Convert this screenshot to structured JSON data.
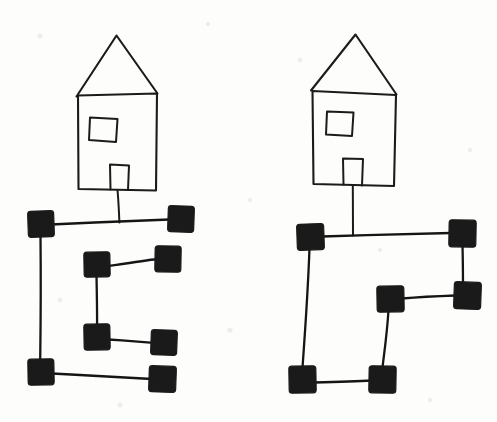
{
  "page": {
    "width": 497,
    "height": 422,
    "background_color": "#fdfdfc",
    "ink_color": "#1b1b1b",
    "node_fill_color": "#1a1a1a"
  },
  "figures": [
    {
      "id": "left-figure",
      "label": "Left house and graph",
      "house": {
        "label": "Left house",
        "roof": {
          "apex": [
            117,
            36
          ],
          "left_eave": [
            76,
            96
          ],
          "right_eave": [
            157,
            93
          ]
        },
        "body": {
          "top_left": [
            78,
            95
          ],
          "top_right": [
            157,
            93
          ],
          "bottom_right": [
            156,
            190
          ],
          "bottom_left": [
            78,
            189
          ]
        },
        "window": {
          "top_left": [
            90,
            117
          ],
          "top_right": [
            117,
            119
          ],
          "bottom_right": [
            116,
            142
          ],
          "bottom_left": [
            89,
            140
          ]
        },
        "door": {
          "top_left": [
            110,
            164
          ],
          "top_right": [
            129,
            165
          ],
          "bottom_right": [
            128,
            190
          ],
          "bottom_left": [
            110,
            189
          ]
        },
        "stem": {
          "from": [
            118,
            190
          ],
          "to": [
            119,
            222
          ]
        }
      },
      "graph": {
        "node_size": 25,
        "nodes": [
          {
            "id": "L1",
            "label": "node-top-left",
            "x": 28,
            "y": 211,
            "w": 26,
            "h": 26
          },
          {
            "id": "L2",
            "label": "node-top-right",
            "x": 168,
            "y": 206,
            "w": 26,
            "h": 26
          },
          {
            "id": "L3",
            "label": "node-upper-mid",
            "x": 84,
            "y": 252,
            "w": 26,
            "h": 25
          },
          {
            "id": "L4",
            "label": "node-upper-right",
            "x": 155,
            "y": 246,
            "w": 26,
            "h": 26
          },
          {
            "id": "L5",
            "label": "node-lower-mid",
            "x": 84,
            "y": 324,
            "w": 26,
            "h": 26
          },
          {
            "id": "L6",
            "label": "node-lower-right",
            "x": 151,
            "y": 330,
            "w": 26,
            "h": 25
          },
          {
            "id": "L7",
            "label": "node-bottom-left",
            "x": 28,
            "y": 359,
            "w": 26,
            "h": 26
          },
          {
            "id": "L8",
            "label": "node-bottom-right",
            "x": 149,
            "y": 366,
            "w": 27,
            "h": 26
          }
        ],
        "edges": [
          {
            "id": "LE1",
            "label": "edge-top-horizontal",
            "from": "L1",
            "to": "L2"
          },
          {
            "id": "LE2",
            "label": "edge-left-vertical",
            "from": "L1",
            "to": "L7"
          },
          {
            "id": "LE3",
            "label": "edge-upper-horizontal",
            "from": "L3",
            "to": "L4"
          },
          {
            "id": "LE4",
            "label": "edge-mid-vertical",
            "from": "L3",
            "to": "L5"
          },
          {
            "id": "LE5",
            "label": "edge-lower-horizontal",
            "from": "L5",
            "to": "L6"
          },
          {
            "id": "LE6",
            "label": "edge-bottom-horizontal",
            "from": "L7",
            "to": "L8"
          }
        ]
      }
    },
    {
      "id": "right-figure",
      "label": "Right house and graph",
      "house": {
        "label": "Right house",
        "roof": {
          "apex": [
            356,
            35
          ],
          "left_eave": [
            311,
            90
          ],
          "right_eave": [
            396,
            95
          ]
        },
        "body": {
          "top_left": [
            312,
            91
          ],
          "top_right": [
            396,
            95
          ],
          "bottom_right": [
            394,
            186
          ],
          "bottom_left": [
            313,
            184
          ]
        },
        "window": {
          "top_left": [
            327,
            111
          ],
          "top_right": [
            353,
            112
          ],
          "bottom_right": [
            352,
            136
          ],
          "bottom_left": [
            326,
            134
          ]
        },
        "door": {
          "top_left": [
            343,
            158
          ],
          "top_right": [
            363,
            159
          ],
          "bottom_right": [
            362,
            185
          ],
          "bottom_left": [
            343,
            184
          ]
        },
        "stem": {
          "from": [
            353,
            185
          ],
          "to": [
            353,
            235
          ]
        }
      },
      "graph": {
        "node_size": 25,
        "nodes": [
          {
            "id": "R1",
            "label": "node-top-left",
            "x": 297,
            "y": 224,
            "w": 27,
            "h": 26
          },
          {
            "id": "R2",
            "label": "node-top-right",
            "x": 449,
            "y": 220,
            "w": 27,
            "h": 27
          },
          {
            "id": "R3",
            "label": "node-mid-left",
            "x": 377,
            "y": 286,
            "w": 27,
            "h": 26
          },
          {
            "id": "R4",
            "label": "node-mid-right",
            "x": 454,
            "y": 282,
            "w": 27,
            "h": 27
          },
          {
            "id": "R5",
            "label": "node-bottom-left",
            "x": 289,
            "y": 366,
            "w": 27,
            "h": 27
          },
          {
            "id": "R6",
            "label": "node-bottom-right",
            "x": 369,
            "y": 366,
            "w": 27,
            "h": 27
          }
        ],
        "edges": [
          {
            "id": "RE1",
            "label": "edge-top-horizontal",
            "from": "R1",
            "to": "R2"
          },
          {
            "id": "RE2",
            "label": "edge-right-vertical",
            "from": "R2",
            "to": "R4"
          },
          {
            "id": "RE3",
            "label": "edge-mid-horizontal",
            "from": "R3",
            "to": "R4"
          },
          {
            "id": "RE4",
            "label": "edge-left-vertical",
            "from": "R1",
            "to": "R5"
          },
          {
            "id": "RE5",
            "label": "edge-mid-down-vertical",
            "from": "R3",
            "to": "R6"
          },
          {
            "id": "RE6",
            "label": "edge-bottom-horizontal",
            "from": "R5",
            "to": "R6"
          }
        ]
      }
    }
  ]
}
